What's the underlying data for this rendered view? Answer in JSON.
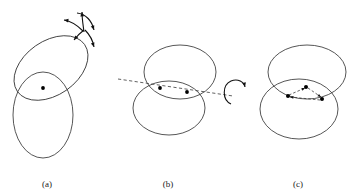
{
  "figure": {
    "background_color": "#ffffff",
    "stroke_color": "#2b2b2b",
    "dash_color": "#3a3a3a",
    "arrow_color": "#111111",
    "dot_color": "#000000",
    "panels": [
      {
        "id": "a",
        "label": "(a)",
        "label_x": 47,
        "label_y": 187,
        "description": "two overlapping ellipses, one tilted upper-right and one upright below, with a single dot at the shared region and a set of curved motion arrows above right",
        "ellipses": [
          {
            "name": "tilted-ellipse",
            "cx": 51,
            "cy": 68,
            "rx": 41,
            "ry": 27,
            "rotation": -35
          },
          {
            "name": "upright-ellipse",
            "cx": 43,
            "cy": 115,
            "rx": 30,
            "ry": 43,
            "rotation": 0
          }
        ],
        "dots": [
          {
            "name": "center-dot",
            "cx": 43,
            "cy": 88,
            "r": 1.9
          }
        ],
        "arrows": [
          {
            "name": "arrow-up",
            "d": "M 84 32 C 83 24 82 19 82 12",
            "head_angle": -92
          },
          {
            "name": "arrow-left",
            "d": "M 83 31 C 76 24 71 21 64 20",
            "head_angle": 188
          },
          {
            "name": "arrow-down-left",
            "d": "M 84 30 C 80 33 77 36 74 40",
            "head_angle": 128
          },
          {
            "name": "arrow-down-right",
            "d": "M 85 30 C 90 35 93 41 94 47",
            "head_angle": 72
          },
          {
            "name": "arrow-sweep",
            "d": "M 77 13 C 86 14 92 21 94 30",
            "head_angle": 70
          }
        ]
      },
      {
        "id": "b",
        "label": "(b)",
        "label_x": 168,
        "label_y": 187,
        "description": "two overlapping horizontal ellipses with a dashed rotation axis passing through the lens-shaped overlap, two dots on the axis, and a circular rotation arrow at right",
        "ellipses": [
          {
            "name": "upper-ellipse",
            "cx": 180,
            "cy": 72,
            "rx": 36,
            "ry": 27,
            "rotation": 0
          },
          {
            "name": "lower-ellipse",
            "cx": 169,
            "cy": 108,
            "rx": 36,
            "ry": 27,
            "rotation": 0
          }
        ],
        "axis": {
          "name": "rotation-axis",
          "x1": 118,
          "y1": 79,
          "x2": 233,
          "y2": 96
        },
        "dots": [
          {
            "name": "axis-dot-left",
            "cx": 160,
            "cy": 88,
            "r": 1.9
          },
          {
            "name": "axis-dot-right",
            "cx": 187,
            "cy": 92,
            "r": 1.9
          }
        ],
        "arrows": [
          {
            "name": "rotation-arrow",
            "d": "M 231 104 C 222 100 222 85 231 81 C 238 78 244 82 245 87",
            "head_angle": 78
          }
        ]
      },
      {
        "id": "c",
        "label": "(c)",
        "label_x": 298,
        "label_y": 187,
        "description": "two overlapping horizontal ellipses with three dots inside the overlap joined by a dashed triangle with arrowheads",
        "ellipses": [
          {
            "name": "upper-ellipse",
            "cx": 307,
            "cy": 72,
            "rx": 39,
            "ry": 27,
            "rotation": 0
          },
          {
            "name": "lower-ellipse",
            "cx": 299,
            "cy": 109,
            "rx": 39,
            "ry": 30,
            "rotation": 0
          }
        ],
        "dots": [
          {
            "name": "triangle-dot-top",
            "cx": 306,
            "cy": 87,
            "r": 2.0
          },
          {
            "name": "triangle-dot-left",
            "cx": 288,
            "cy": 96,
            "r": 2.0
          },
          {
            "name": "triangle-dot-right",
            "cx": 322,
            "cy": 99,
            "r": 2.0
          }
        ],
        "links": [
          {
            "name": "link-left-to-top",
            "x1": 289,
            "y1": 95,
            "x2": 305,
            "y2": 88,
            "head_angle": -24
          },
          {
            "name": "link-top-to-right",
            "x1": 308,
            "y1": 88,
            "x2": 321,
            "y2": 97,
            "head_angle": 35
          },
          {
            "name": "link-right-to-left",
            "x1": 320,
            "y1": 100,
            "x2": 290,
            "y2": 97,
            "head_angle": 186
          }
        ]
      }
    ]
  }
}
